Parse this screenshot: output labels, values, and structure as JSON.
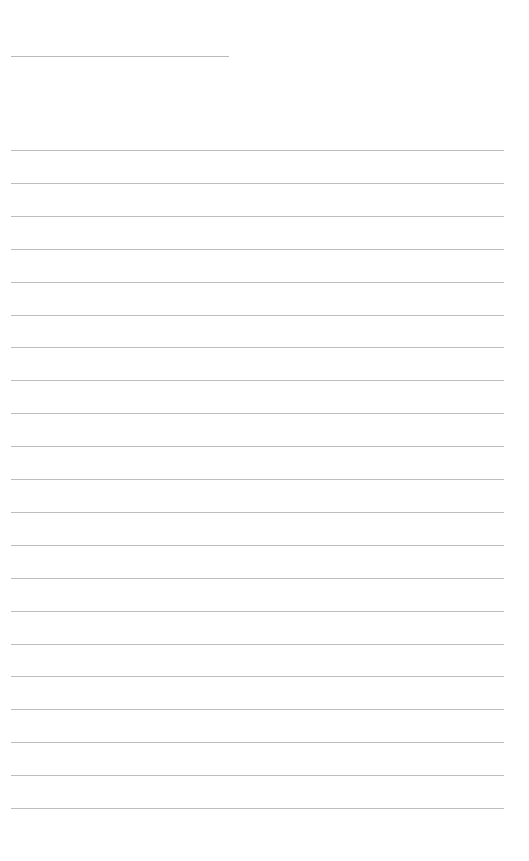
{
  "page": {
    "background": "#ffffff",
    "line_color": "#bdbdbd",
    "title_line": {
      "label": "",
      "present": true
    },
    "ruled_lines": {
      "count": 21,
      "spacing_px": 32.9,
      "values": [
        "",
        "",
        "",
        "",
        "",
        "",
        "",
        "",
        "",
        "",
        "",
        "",
        "",
        "",
        "",
        "",
        "",
        "",
        "",
        "",
        ""
      ]
    }
  }
}
